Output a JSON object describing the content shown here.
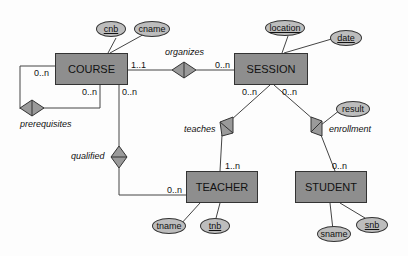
{
  "entities": {
    "course": "COURSE",
    "session": "SESSION",
    "teacher": "TEACHER",
    "student": "STUDENT"
  },
  "attributes": {
    "cnb": "cnb",
    "cname": "cname",
    "location": "location",
    "date": "date",
    "result": "result",
    "tname": "tname",
    "tnb": "tnb",
    "sname": "sname",
    "snb": "snb"
  },
  "relationships": {
    "organizes": "organizes",
    "prerequisites": "prerequisites",
    "qualified": "qualified",
    "teaches": "teaches",
    "enrollment": "enrollment"
  },
  "cardinalities": {
    "course_organizes": "1..1",
    "session_organizes": "0..n",
    "course_prereq_left": "0..n",
    "course_prereq_bottom": "0..n",
    "course_qualified": "0..n",
    "teacher_qualified": "0..n",
    "session_teaches": "0..n",
    "session_enrollment": "0..n",
    "teacher_teaches": "1..n",
    "student_enrollment": "0..n"
  }
}
